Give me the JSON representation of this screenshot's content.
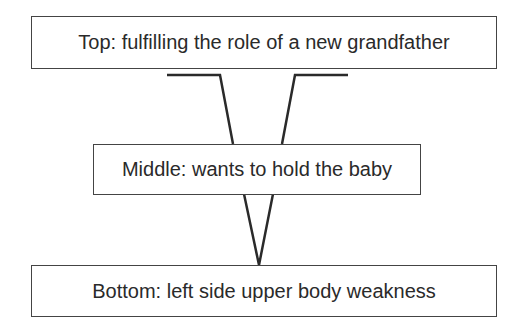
{
  "diagram": {
    "levels": [
      {
        "position": "top",
        "label": "Top: fulfilling the role of a new grandfather"
      },
      {
        "position": "middle",
        "label": "Middle: wants to hold the baby"
      },
      {
        "position": "bottom",
        "label": "Bottom: left side upper body weakness"
      }
    ],
    "line_color": "#2a2a2a"
  }
}
